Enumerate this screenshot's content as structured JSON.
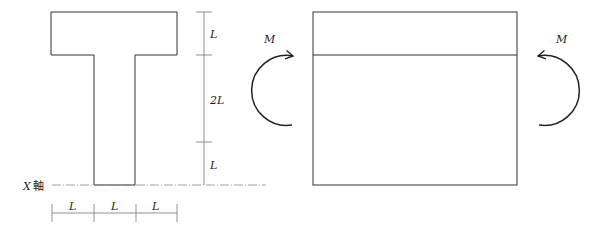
{
  "figure": {
    "section": {
      "dimension_labels": {
        "vertical": [
          "L",
          "2L",
          "L"
        ],
        "horizontal": [
          "L",
          "L",
          "L"
        ]
      },
      "axis_label_var": "X",
      "axis_label_text": "軸"
    },
    "beam": {
      "moment_left": "M",
      "moment_right": "M"
    },
    "colors": {
      "line": "#333333",
      "dim_line": "#666666",
      "axis_dash": "#888888"
    }
  }
}
